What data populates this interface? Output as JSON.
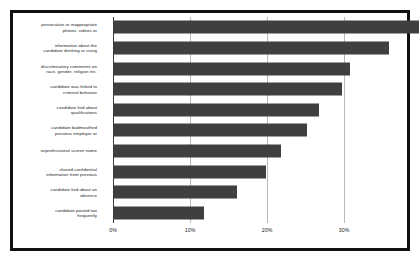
{
  "chart_data": {
    "type": "bar",
    "orientation": "horizontal",
    "title": "",
    "xlabel": "",
    "ylabel": "",
    "grid": true,
    "legend": null,
    "xlim": [
      0,
      39.6
    ],
    "xticks": [
      "0%",
      "10%",
      "20%",
      "30%"
    ],
    "xtick_values": [
      0,
      10,
      20,
      30
    ],
    "categories": [
      "provocative or inappropriate photos, videos or",
      "information about the candidate drinking or using",
      "discriminatory comments on race, gender, religion etc.",
      "candidate was linked to criminal behavior",
      "candidate lied about qualifications",
      "candidate badmouthed previous employer or",
      "unprofessional screen name",
      "shared confidential information from previous",
      "candidate lied about an absence",
      "candidate posted too frequently"
    ],
    "values": [
      39.6,
      35.7,
      30.6,
      29.6,
      26.6,
      25.0,
      21.7,
      19.8,
      16.0,
      11.7
    ],
    "bar_color": "#3f3f3f",
    "grid_color": "#b9b9b9",
    "axis_color": "#3a3a3a",
    "frame_color": "#111111",
    "background": "#ffffff"
  },
  "labels": [
    {
      "line1": "provocative or inappropriate",
      "line2": "photos, videos or"
    },
    {
      "line1": "information about the",
      "line2": "candidate drinking or using"
    },
    {
      "line1": "discriminatory comments on",
      "line2": "race, gender, religion etc."
    },
    {
      "line1": "candidate was linked to",
      "line2": "criminal behavior"
    },
    {
      "line1": "candidate lied about",
      "line2": "qualifications"
    },
    {
      "line1": "candidate badmouthed",
      "line2": "previous employer or"
    },
    {
      "line1": "unprofessional screen name",
      "line2": ""
    },
    {
      "line1": "shared confidential",
      "line2": "information from previous"
    },
    {
      "line1": "candidate lied about an",
      "line2": "absence"
    },
    {
      "line1": "candidate posted too",
      "line2": "frequently"
    }
  ]
}
